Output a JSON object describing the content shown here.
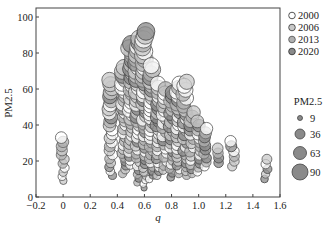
{
  "chart_data": {
    "type": "scatter",
    "subtype": "bubble",
    "title": "",
    "xlabel": "q",
    "ylabel": "PM2.5",
    "xlim": [
      -0.2,
      1.6
    ],
    "ylim": [
      0,
      105
    ],
    "xticks": [
      -0.2,
      0,
      0.2,
      0.4,
      0.6,
      0.8,
      1.0,
      1.2,
      1.4,
      1.6
    ],
    "xtick_labels": [
      "−0.2",
      "0",
      "0.2",
      "0.4",
      "0.6",
      "0.8",
      "1.0",
      "1.2",
      "1.4",
      "1.6"
    ],
    "yticks": [
      0,
      20,
      40,
      60,
      80,
      100
    ],
    "ytick_labels": [
      "0",
      "20",
      "40",
      "60",
      "80",
      "100"
    ],
    "grid": false,
    "legend_position": "right",
    "series": [
      {
        "name": "2000",
        "color": "#ffffff",
        "stroke": "#555555"
      },
      {
        "name": "2006",
        "color": "#c8c8c8",
        "stroke": "#555555"
      },
      {
        "name": "2013",
        "color": "#b0b0b0",
        "stroke": "#666666"
      },
      {
        "name": "2020",
        "color": "#8a8a8a",
        "stroke": "#444444"
      }
    ],
    "size_legend": {
      "title": "PM2.5",
      "values": [
        9,
        36,
        63,
        90
      ]
    },
    "columns": [
      {
        "q": 0.0,
        "ymin": 9,
        "ymax": 33
      },
      {
        "q": 0.35,
        "ymin": 12,
        "ymax": 65
      },
      {
        "q": 0.45,
        "ymin": 13,
        "ymax": 72
      },
      {
        "q": 0.5,
        "ymin": 18,
        "ymax": 85
      },
      {
        "q": 0.55,
        "ymin": 8,
        "ymax": 88
      },
      {
        "q": 0.6,
        "ymin": 5,
        "ymax": 92
      },
      {
        "q": 0.65,
        "ymin": 10,
        "ymax": 73
      },
      {
        "q": 0.7,
        "ymin": 12,
        "ymax": 63
      },
      {
        "q": 0.75,
        "ymin": 15,
        "ymax": 60
      },
      {
        "q": 0.8,
        "ymin": 11,
        "ymax": 58
      },
      {
        "q": 0.85,
        "ymin": 13,
        "ymax": 63
      },
      {
        "q": 0.9,
        "ymin": 12,
        "ymax": 64
      },
      {
        "q": 0.95,
        "ymin": 13,
        "ymax": 47
      },
      {
        "q": 1.0,
        "ymin": 14,
        "ymax": 42
      },
      {
        "q": 1.05,
        "ymin": 17,
        "ymax": 38
      },
      {
        "q": 1.15,
        "ymin": 19,
        "ymax": 27
      },
      {
        "q": 1.25,
        "ymin": 17,
        "ymax": 31
      },
      {
        "q": 1.5,
        "ymin": 10,
        "ymax": 21
      }
    ]
  },
  "legend": {
    "years": [
      "2000",
      "2006",
      "2013",
      "2020"
    ],
    "size_title": "PM2.5",
    "sizes": [
      "9",
      "36",
      "63",
      "90"
    ]
  },
  "axes": {
    "xlabel": "q",
    "ylabel": "PM2.5"
  }
}
